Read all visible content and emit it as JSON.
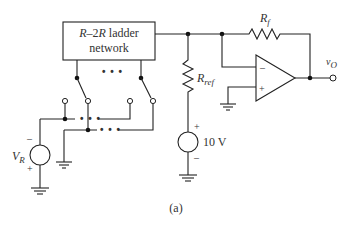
{
  "figure": {
    "caption": "(a)",
    "ladder_box": {
      "line1_italic": "R",
      "line1_dash": "–2",
      "line1_italic2": "R",
      "line1_rest": " ladder",
      "line2": "network"
    },
    "ellipsis": "• • •",
    "feedback_resistor": {
      "main": "R",
      "sub": "f"
    },
    "reference_resistor": {
      "main": "R",
      "sub": "ref"
    },
    "reference_source": {
      "value": "10 V",
      "plus": "+",
      "minus": "–"
    },
    "input_source": {
      "main": "V",
      "sub": "R",
      "plus": "+",
      "minus": "–"
    },
    "opamp": {
      "inverting": "–",
      "noninverting": "+"
    },
    "output": {
      "main": "v",
      "sub": "O"
    }
  }
}
